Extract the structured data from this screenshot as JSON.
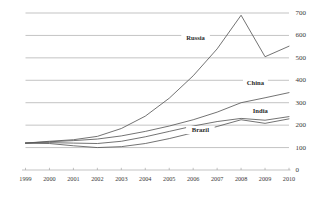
{
  "chart_data": {
    "type": "line",
    "title": "",
    "subtitle": "",
    "xlabel": "",
    "ylabel": "",
    "x": [
      1999,
      2000,
      2001,
      2002,
      2003,
      2004,
      2005,
      2006,
      2007,
      2008,
      2009,
      2010
    ],
    "categories": [
      "1999",
      "2000",
      "2001",
      "2002",
      "2003",
      "2004",
      "2005",
      "2006",
      "2007",
      "2008",
      "2009",
      "2010"
    ],
    "xlim": [
      1999,
      2010
    ],
    "ylim": [
      0,
      700
    ],
    "y_ticks": [
      0,
      100,
      200,
      300,
      400,
      500,
      600,
      700
    ],
    "y_tick_labels": [
      "0",
      "100",
      "200",
      "300",
      "400",
      "500",
      "600",
      "700"
    ],
    "y_axis_position": "right",
    "grid": true,
    "grid_axis": "y",
    "legend": "inline-labels",
    "legend_position": "inline",
    "series": [
      {
        "name": "Russia",
        "label": "Russia",
        "color": "#5a5a5a",
        "values": [
          120,
          128,
          135,
          150,
          185,
          240,
          320,
          420,
          540,
          690,
          505,
          552
        ],
        "label_x": 2006.1,
        "label_y": 588
      },
      {
        "name": "China",
        "label": "China",
        "color": "#5a5a5a",
        "values": [
          120,
          126,
          131,
          138,
          152,
          172,
          196,
          224,
          258,
          300,
          322,
          345
        ],
        "label_x": 2008.6,
        "label_y": 386
      },
      {
        "name": "India",
        "label": "India",
        "color": "#5a5a5a",
        "values": [
          120,
          122,
          120,
          118,
          128,
          148,
          172,
          196,
          216,
          230,
          222,
          238
        ],
        "label_x": 2008.8,
        "label_y": 262
      },
      {
        "name": "Brazil",
        "label": "Brazil",
        "color": "#5a5a5a",
        "values": [
          120,
          118,
          108,
          100,
          104,
          118,
          140,
          166,
          194,
          224,
          208,
          228
        ],
        "label_x": 2006.3,
        "label_y": 176
      }
    ]
  },
  "axes": {
    "y_tick_labels": [
      "0",
      "100",
      "200",
      "300",
      "400",
      "500",
      "600",
      "700"
    ],
    "x_tick_labels": [
      "1999",
      "2000",
      "2001",
      "2002",
      "2003",
      "2004",
      "2005",
      "2006",
      "2007",
      "2008",
      "2009",
      "2010"
    ]
  },
  "series_labels": {
    "russia": "Russia",
    "china": "China",
    "india": "India",
    "brazil": "Brazil"
  },
  "colors": {
    "background": "#ffffff",
    "grid": "#9a9a9a",
    "line": "#5a5a5a",
    "text": "#3a3a3a"
  }
}
